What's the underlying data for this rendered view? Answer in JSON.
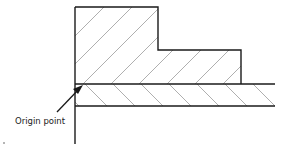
{
  "diagram": {
    "annotation": {
      "label": "Origin point"
    },
    "colors": {
      "outline": "#1a1a1a",
      "hatch": "#9a9a9a",
      "background": "#ffffff"
    }
  }
}
